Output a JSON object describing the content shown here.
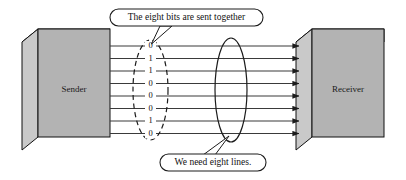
{
  "diagram": {
    "colors": {
      "box_front": "#b3b3b3",
      "box_side": "#c9c9c9",
      "box_top": "#6e6e6e",
      "outline": "#111111",
      "line": "#3a3a3a",
      "callout_fill": "#ffffff",
      "background": "#ffffff"
    },
    "sender": {
      "label": "Sender"
    },
    "receiver": {
      "label": "Receiver"
    },
    "bits": [
      "0",
      "1",
      "1",
      "0",
      "0",
      "0",
      "1",
      "0"
    ],
    "line_count": 8,
    "callouts": [
      {
        "id": "bits-callout",
        "text": "The eight bits are sent together"
      },
      {
        "id": "lines-callout",
        "text": "We need eight lines."
      }
    ],
    "annotations": {
      "dashed_ellipse_name": "bit-group-ellipse",
      "solid_ellipse_name": "line-group-ellipse"
    }
  }
}
